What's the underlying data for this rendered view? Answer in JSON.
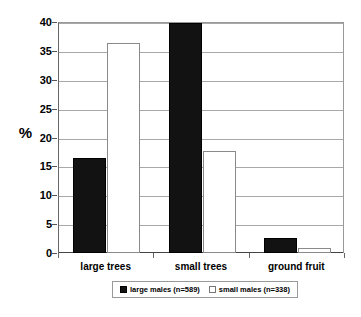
{
  "chart_data": {
    "type": "bar",
    "title": "",
    "subtitle": "",
    "xlabel": "",
    "ylabel": "%",
    "ylim": [
      0,
      40
    ],
    "ytick_step": 5,
    "yticks": [
      0,
      5,
      10,
      15,
      20,
      25,
      30,
      35,
      40
    ],
    "ytick_labels": [
      "0",
      "5",
      "10",
      "15",
      "20",
      "25",
      "30",
      "35",
      "40"
    ],
    "grid": true,
    "legend_position": "bottom",
    "categories": [
      "large trees",
      "small trees",
      "ground fruit"
    ],
    "series": [
      {
        "name": "large males (n=589)",
        "label": "large males",
        "count_label": "(n=589)",
        "n": 589,
        "color": "#121212",
        "style": "filled-black",
        "values": [
          16.5,
          39.8,
          2.6
        ]
      },
      {
        "name": "small males (n=338)",
        "label": "small males",
        "count_label": "(n=338)",
        "n": 338,
        "color": "#ffffff",
        "style": "open-white",
        "values": [
          36.4,
          17.7,
          0.8
        ]
      }
    ]
  },
  "axis": {
    "y_title": "%"
  },
  "colors": {
    "series_dark": "#121212",
    "series_light": "#ffffff",
    "gridline": "#a8a8a8",
    "axis": "#666666",
    "background": "#ffffff"
  }
}
